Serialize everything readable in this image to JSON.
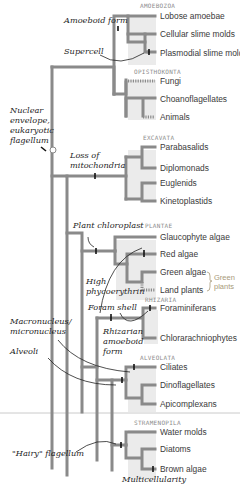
{
  "diagram": {
    "type": "phylogenetic-tree",
    "groups": [
      {
        "name": "AMOEBOZOA",
        "taxa": [
          "Lobose amoebae",
          "Cellular slime molds",
          "Plasmodial slime molds"
        ]
      },
      {
        "name": "OPISTHOKONTA",
        "taxa": [
          "Fungi",
          "Choanoflagellates",
          "Animals"
        ]
      },
      {
        "name": "EXCAVATA",
        "taxa": [
          "Parabasalids",
          "Diplomonads",
          "Euglenids",
          "Kinetoplastids"
        ]
      },
      {
        "name": "PLANTAE",
        "taxa": [
          "Glaucophyte algae",
          "Red algae",
          "Green algae",
          "Land plants"
        ],
        "bracket_label": "Green plants"
      },
      {
        "name": "RHIZARIA",
        "taxa": [
          "Foraminiferans",
          "Chlorarachniophytes"
        ]
      },
      {
        "name": "ALVEOLATA",
        "taxa": [
          "Ciliates",
          "Dinoflagellates",
          "Apicomplexans"
        ]
      },
      {
        "name": "STRAMENOPILA",
        "taxa": [
          "Water molds",
          "Diatoms",
          "Brown algae"
        ]
      }
    ],
    "annotations": {
      "amoeboid_form": "Amoeboid form",
      "supercell": "Supercell",
      "nuclear_1": "Nuclear",
      "nuclear_2": "envelope,",
      "nuclear_3": "eukaryotic",
      "nuclear_4": "flagellum",
      "loss_1": "Loss of",
      "loss_2": "mitochondria",
      "plant_chloroplast": "Plant chloroplast",
      "high_1": "High",
      "high_2": "phycoerythrin",
      "foram_shell": "Foram shell",
      "macro_1": "Macronucleus/",
      "macro_2": "micronucleus",
      "rhiz_1": "Rhizarian",
      "rhiz_2": "amoeboid",
      "rhiz_3": "form",
      "alveoli": "Alveoli",
      "hairy": "\"Hairy\" flagellum",
      "multicellularity": "Multicellularity"
    },
    "green_plants_1": "Green",
    "green_plants_2": "plants",
    "colors": {
      "branch": "#8a8a8a",
      "shade": "#ebebeb",
      "group_label": "#8c8c8c",
      "text": "#3a3a3a",
      "bracket": "#a89a7a"
    }
  }
}
